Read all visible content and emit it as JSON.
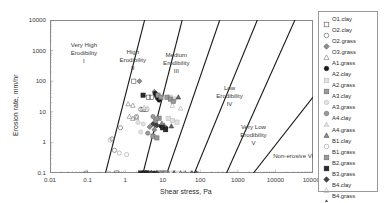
{
  "chart_data": {
    "type": "scatter",
    "title": "",
    "xlabel": "Shear stress, Pa",
    "ylabel": "Erosion rate, mm/hr",
    "xscale": "log",
    "yscale": "log",
    "xlim": [
      0.01,
      100000
    ],
    "ylim": [
      0.1,
      10000
    ],
    "xticks": [
      "0.01",
      "0.1",
      "1",
      "10",
      "100",
      "1000",
      "10000",
      "100000"
    ],
    "yticks": [
      "0.1",
      "1",
      "10",
      "100",
      "1000",
      "10000"
    ],
    "grid": false,
    "legend_position": "right-outside",
    "annotations": [
      {
        "name": "zone-1",
        "lines": [
          "Very High",
          "Erodibility",
          "I"
        ],
        "x": 0.08,
        "y": 1500
      },
      {
        "name": "zone-2",
        "lines": [
          "High",
          "Erodibility",
          "II"
        ],
        "x": 1.6,
        "y": 900
      },
      {
        "name": "zone-3",
        "lines": [
          "Medium",
          "Erodibility",
          "III"
        ],
        "x": 23,
        "y": 700
      },
      {
        "name": "zone-4",
        "lines": [
          "Low",
          "Erodibility",
          "IV"
        ],
        "x": 600,
        "y": 60
      },
      {
        "name": "zone-5",
        "lines": [
          "Very Low",
          "Erodibility",
          "V"
        ],
        "x": 2600,
        "y": 3.2
      },
      {
        "name": "zone-6",
        "lines": [
          "Non-erosive VI"
        ],
        "x": 30000,
        "y": 0.35
      }
    ],
    "boundary_lines": [
      {
        "name": "boundary-I-II",
        "x0": 0.3,
        "y0": 0.1,
        "x1": 3.3,
        "y1": 10000
      },
      {
        "name": "boundary-II-III",
        "x0": 3.0,
        "y0": 0.1,
        "x1": 33,
        "y1": 10000
      },
      {
        "name": "boundary-III-IV",
        "x0": 13,
        "y0": 0.1,
        "x1": 330,
        "y1": 10000
      },
      {
        "name": "boundary-IV-V",
        "x0": 70,
        "y0": 0.1,
        "x1": 3300,
        "y1": 10000
      },
      {
        "name": "boundary-V-VI",
        "x0": 500,
        "y0": 0.1,
        "x1": 33000,
        "y1": 10000
      },
      {
        "name": "boundary-VI-end",
        "x0": 2600,
        "y0": 0.1,
        "x1": 100000,
        "y1": 30
      }
    ],
    "series": [
      {
        "name": "O1.clay",
        "marker": "square",
        "fill": "none",
        "edge": "#555555",
        "points": [
          [
            0.6,
            0.1
          ],
          [
            1.7,
            100
          ],
          [
            4.2,
            30
          ],
          [
            5.0,
            30
          ],
          [
            3.0,
            12
          ],
          [
            3.6,
            12
          ]
        ]
      },
      {
        "name": "O2.clay",
        "marker": "circle",
        "fill": "none",
        "edge": "#555555",
        "points": [
          [
            0.09,
            0.1
          ],
          [
            0.45,
            1.3
          ],
          [
            0.52,
            0.55
          ],
          [
            0.75,
            3.0
          ],
          [
            2.6,
            12
          ],
          [
            2.0,
            7.0
          ]
        ]
      },
      {
        "name": "O2.grass",
        "marker": "diamond",
        "fill": "#8f8f8f",
        "edge": "#555555",
        "points": [
          [
            2.4,
            100
          ],
          [
            6.0,
            45
          ],
          [
            6.5,
            40
          ],
          [
            7.0,
            35
          ],
          [
            4.5,
            3.2
          ],
          [
            6.0,
            2.6
          ]
        ]
      },
      {
        "name": "O3.grass",
        "marker": "triangle",
        "fill": "none",
        "edge": "#777777",
        "points": [
          [
            1.2,
            18
          ],
          [
            1.6,
            16
          ],
          [
            1.3,
            7.0
          ],
          [
            1.6,
            6.0
          ],
          [
            2.0,
            6.5
          ],
          [
            9.0,
            0.1
          ]
        ]
      },
      {
        "name": "A1.grass",
        "marker": "circle",
        "fill": "#1a1a1a",
        "edge": "#1a1a1a",
        "points": [
          [
            6.3,
            40
          ],
          [
            6.8,
            33
          ],
          [
            7.2,
            28
          ],
          [
            8.0,
            24
          ],
          [
            9.0,
            3.4
          ],
          [
            12,
            3.0
          ],
          [
            5.0,
            0.1
          ],
          [
            6.0,
            0.1
          ]
        ]
      },
      {
        "name": "A2.clay",
        "marker": "square",
        "fill": "#e2e2e2",
        "edge": "#bdbdbd",
        "points": [
          [
            16,
            30
          ],
          [
            20,
            26
          ],
          [
            14,
            6.0
          ],
          [
            18,
            5.2
          ],
          [
            24,
            4.6
          ],
          [
            20,
            0.1
          ]
        ]
      },
      {
        "name": "A2.grass",
        "marker": "square",
        "fill": "#9a9a9a",
        "edge": "#6a6a6a",
        "points": [
          [
            7.5,
            35
          ],
          [
            9.0,
            30
          ],
          [
            8.0,
            6.2
          ],
          [
            6.5,
            5.0
          ],
          [
            5.5,
            1.6
          ],
          [
            7.0,
            1.4
          ],
          [
            4.0,
            0.1
          ],
          [
            8.0,
            0.1
          ]
        ]
      },
      {
        "name": "A3.clay",
        "marker": "circle",
        "fill": "#e2e2e2",
        "edge": "#bdbdbd",
        "points": [
          [
            2.2,
            4.5
          ],
          [
            3.0,
            4.0
          ],
          [
            2.6,
            2.2
          ],
          [
            13,
            0.1
          ],
          [
            16,
            0.1
          ]
        ]
      },
      {
        "name": "A3.grass",
        "marker": "circle",
        "fill": "#9a9a9a",
        "edge": "#6a6a6a",
        "points": [
          [
            5.5,
            7.0
          ],
          [
            7.0,
            6.0
          ],
          [
            4.0,
            2.0
          ],
          [
            10,
            0.1
          ],
          [
            11,
            0.1
          ]
        ]
      },
      {
        "name": "A4.clay",
        "marker": "triangle",
        "fill": "#e2e2e2",
        "edge": "#c4c4c4",
        "points": [
          [
            3.2,
            14
          ],
          [
            4.0,
            13
          ],
          [
            22,
            0.1
          ],
          [
            26,
            0.1
          ]
        ]
      },
      {
        "name": "A4.grass",
        "marker": "triangle",
        "fill": "#8a8a8a",
        "edge": "#5a5a5a",
        "points": [
          [
            9.5,
            4.2
          ],
          [
            11,
            3.6
          ],
          [
            14,
            0.1
          ],
          [
            30,
            0.1
          ],
          [
            40,
            0.1
          ]
        ]
      },
      {
        "name": "B1.clay",
        "marker": "circle",
        "fill": "none",
        "edge": "#9a9a9a",
        "points": [
          [
            0.4,
            1.2
          ],
          [
            0.7,
            0.45
          ],
          [
            1.1,
            0.4
          ],
          [
            0.35,
            0.1
          ]
        ]
      },
      {
        "name": "B1.grass",
        "marker": "square",
        "fill": "#9a9a9a",
        "edge": "#6a6a6a",
        "points": [
          [
            13,
            30
          ],
          [
            16,
            26
          ],
          [
            19,
            22
          ],
          [
            12,
            0.1
          ]
        ]
      },
      {
        "name": "B2.grass",
        "marker": "square",
        "fill": "#2a2a2a",
        "edge": "#1a1a1a",
        "points": [
          [
            3.0,
            35
          ],
          [
            10,
            3.0
          ],
          [
            12,
            2.6
          ],
          [
            2.6,
            0.1
          ],
          [
            3.2,
            0.1
          ],
          [
            3.8,
            0.1
          ]
        ]
      },
      {
        "name": "B3.grass",
        "marker": "diamond",
        "fill": "#444444",
        "edge": "#2a2a2a",
        "points": [
          [
            5.5,
            4.0
          ],
          [
            7.0,
            3.6
          ],
          [
            5.0,
            0.1
          ],
          [
            7.0,
            0.1
          ]
        ]
      },
      {
        "name": "B4.clay",
        "marker": "triangle",
        "fill": "none",
        "edge": "#aaaaaa",
        "points": [
          [
            18,
            16
          ],
          [
            30,
            13
          ],
          [
            36,
            0.1
          ],
          [
            55,
            0.1
          ]
        ]
      },
      {
        "name": "B4.grass",
        "marker": "triangle",
        "fill": "#6a6a6a",
        "edge": "#3a3a3a",
        "points": [
          [
            26,
            30
          ],
          [
            17,
            3.4
          ],
          [
            20,
            0.1
          ],
          [
            60,
            0.1
          ],
          [
            80,
            0.1
          ]
        ]
      }
    ]
  },
  "legend": {
    "items": [
      {
        "label": "O1.clay"
      },
      {
        "label": "O2.clay"
      },
      {
        "label": "O2.grass"
      },
      {
        "label": "O3.grass"
      },
      {
        "label": "A1.grass"
      },
      {
        "label": "A2.clay"
      },
      {
        "label": "A2.grass"
      },
      {
        "label": "A3.clay"
      },
      {
        "label": "A3.grass"
      },
      {
        "label": "A4.clay"
      },
      {
        "label": "A4.grass"
      },
      {
        "label": "B1.clay"
      },
      {
        "label": "B1.grass"
      },
      {
        "label": "B2.grass"
      },
      {
        "label": "B3.grass"
      },
      {
        "label": "B4.clay"
      },
      {
        "label": "B4.grass"
      }
    ]
  }
}
